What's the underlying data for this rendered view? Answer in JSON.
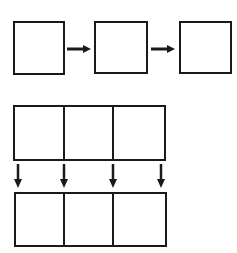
{
  "colors": {
    "stroke": "#1a1a1a",
    "background": "#ffffff"
  },
  "sequence_row": {
    "boxes": [
      {
        "x": 14,
        "y": 22,
        "w": 50,
        "h": 52
      },
      {
        "x": 95,
        "y": 22,
        "w": 52,
        "h": 51
      },
      {
        "x": 180,
        "y": 22,
        "w": 51,
        "h": 51
      }
    ],
    "arrows": [
      {
        "x1": 67,
        "y1": 49,
        "x2": 91,
        "y2": 49,
        "icon": "arrow-right-icon"
      },
      {
        "x1": 151,
        "y1": 49,
        "x2": 175,
        "y2": 49,
        "icon": "arrow-right-icon"
      }
    ]
  },
  "top_grid": {
    "x": 14,
    "y": 106,
    "w": 151,
    "h": 54,
    "dividers": [
      64,
      113
    ]
  },
  "down_arrows": [
    {
      "x": 18,
      "y1": 164,
      "y2": 188,
      "icon": "arrow-down-icon"
    },
    {
      "x": 64,
      "y1": 164,
      "y2": 188,
      "icon": "arrow-down-icon"
    },
    {
      "x": 113,
      "y1": 164,
      "y2": 188,
      "icon": "arrow-down-icon"
    },
    {
      "x": 161,
      "y1": 164,
      "y2": 188,
      "icon": "arrow-down-icon"
    }
  ],
  "bottom_grid": {
    "x": 15,
    "y": 193,
    "w": 151,
    "h": 53,
    "dividers": [
      64,
      113
    ]
  }
}
